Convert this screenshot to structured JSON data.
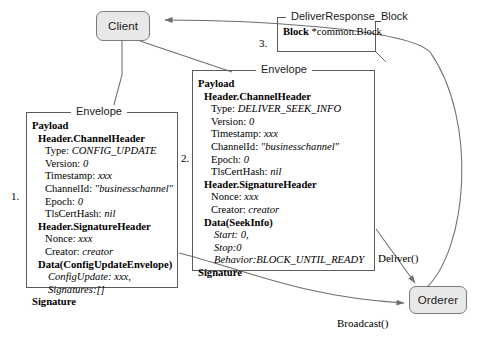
{
  "diagram": {
    "nodes": {
      "client": {
        "label": "Client"
      },
      "orderer": {
        "label": "Orderer"
      }
    },
    "steps": {
      "one": "1.",
      "two": "2.",
      "three": "3."
    },
    "edge_labels": {
      "deliver": "Deliver()",
      "broadcast": "Broadcast()"
    },
    "boxes": {
      "config_envelope": {
        "legend": "Envelope",
        "lines": [
          {
            "text": "Payload",
            "style": "bold",
            "indent": 0
          },
          {
            "text": "Header.ChannelHeader",
            "style": "bold",
            "indent": 1
          },
          {
            "label": "Type: ",
            "value": "CONFIG_UPDATE",
            "indent": 2
          },
          {
            "label": "Version: ",
            "value": "0",
            "indent": 2
          },
          {
            "label": "Timestamp: ",
            "value": "xxx",
            "indent": 2
          },
          {
            "label": "ChannelId: ",
            "value": "\"businesschannel\"",
            "indent": 2
          },
          {
            "label": "Epoch: ",
            "value": "0",
            "indent": 2
          },
          {
            "label": "TlsCertHash: ",
            "value": "nil",
            "indent": 2
          },
          {
            "text": "Header.SignatureHeader",
            "style": "bold",
            "indent": 1
          },
          {
            "label": "Nonce: ",
            "value": "xxx",
            "indent": 2
          },
          {
            "label": "Creator: ",
            "value": "creator",
            "indent": 2
          },
          {
            "text": "Data(ConfigUpdateEnvelope)",
            "style": "bold",
            "indent": 1
          },
          {
            "label": "",
            "value": "ConfigUpdate: xxx,",
            "indent": 3
          },
          {
            "label": "",
            "value": "Signatures:[]",
            "indent": 3
          },
          {
            "text": "Signature",
            "style": "bold",
            "indent": 0
          }
        ]
      },
      "seek_envelope": {
        "legend": "Envelope",
        "lines": [
          {
            "text": "Payload",
            "style": "bold",
            "indent": 0
          },
          {
            "text": "Header.ChannelHeader",
            "style": "bold",
            "indent": 1
          },
          {
            "label": "Type: ",
            "value": "DELIVER_SEEK_INFO",
            "indent": 2
          },
          {
            "label": "Version: ",
            "value": "0",
            "indent": 2
          },
          {
            "label": "Timestamp: ",
            "value": "xxx",
            "indent": 2
          },
          {
            "label": "ChannelId: ",
            "value": "\"businesschannel\"",
            "indent": 2
          },
          {
            "label": "Epoch: ",
            "value": "0",
            "indent": 2
          },
          {
            "label": "TlsCertHash: ",
            "value": "nil",
            "indent": 2
          },
          {
            "text": "Header.SignatureHeader",
            "style": "bold",
            "indent": 1
          },
          {
            "label": "Nonce: ",
            "value": "xxx",
            "indent": 2
          },
          {
            "label": "Creator: ",
            "value": "creator",
            "indent": 2
          },
          {
            "text": "Data(SeekInfo)",
            "style": "bold",
            "indent": 1
          },
          {
            "label": "",
            "value": "Start: 0,",
            "indent": 3
          },
          {
            "label": "",
            "value": "Stop:0",
            "indent": 3
          },
          {
            "label": "",
            "value": "Behavior:BLOCK_UNTIL_READY",
            "indent": 3
          },
          {
            "text": "Signature",
            "style": "bold",
            "indent": 0
          }
        ]
      },
      "deliver_response": {
        "legend": "DeliverResponse_Block",
        "lines": [
          {
            "bold_part": "Block",
            "rest": " *common.Block"
          }
        ]
      }
    },
    "colors": {
      "node_fill": "#e8e8e8",
      "node_stroke": "#7a7a7a",
      "box_stroke": "#5c5c5c",
      "edge_stroke": "#6e6e6e",
      "text": "#000000",
      "background": "#ffffff"
    }
  }
}
